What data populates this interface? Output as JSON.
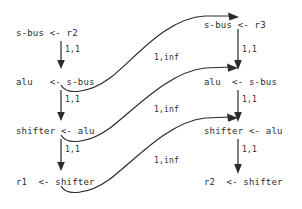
{
  "diagram": {
    "stroke_color": "#2b2b2b",
    "background_color": "#ffffff",
    "left_column": {
      "name": "left-chain",
      "nodes": [
        {
          "id": "l1",
          "text": "s-bus <- r2"
        },
        {
          "id": "l2",
          "text": "alu   <- s-bus"
        },
        {
          "id": "l3",
          "text": "shifter <- alu"
        },
        {
          "id": "l4",
          "text": "r1  <- shifter"
        }
      ],
      "edge_labels": [
        "1,1",
        "1,1",
        "1,1"
      ]
    },
    "right_column": {
      "name": "right-chain",
      "nodes": [
        {
          "id": "r1",
          "text": "s-bus <- r3"
        },
        {
          "id": "r2",
          "text": "alu  <- s-bus"
        },
        {
          "id": "r3",
          "text": "shifter <- alu"
        },
        {
          "id": "r4",
          "text": "r2  <- shifter"
        }
      ],
      "edge_labels": [
        "1,1",
        "1,1",
        "1,1"
      ]
    },
    "cross_edges": [
      {
        "id": "c1",
        "label": "1,inf",
        "from": "l2",
        "to": "r1"
      },
      {
        "id": "c2",
        "label": "1,inf",
        "from": "l3",
        "to": "r2"
      },
      {
        "id": "c3",
        "label": "1,inf",
        "from": "l4",
        "to": "r3"
      }
    ]
  }
}
